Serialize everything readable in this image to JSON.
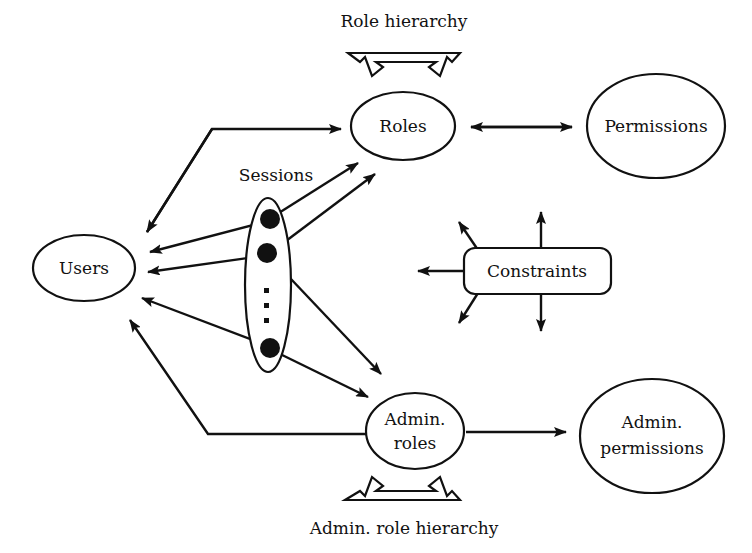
{
  "diagram": {
    "type": "node-link-diagram",
    "background_color": "#ffffff",
    "stroke_color": "#111111",
    "nodes": [
      {
        "id": "users",
        "label": "Users",
        "shape": "ellipse"
      },
      {
        "id": "roles",
        "label": "Roles",
        "shape": "ellipse"
      },
      {
        "id": "permissions",
        "label": "Permissions",
        "shape": "ellipse"
      },
      {
        "id": "sessions",
        "label": "Sessions",
        "shape": "tall-ellipse-with-dots"
      },
      {
        "id": "constraints",
        "label": "Constraints",
        "shape": "rounded-rectangle"
      },
      {
        "id": "admin-roles",
        "label_line1": "Admin.",
        "label_line2": "roles",
        "shape": "ellipse"
      },
      {
        "id": "admin-permissions",
        "label_line1": "Admin.",
        "label_line2": "permissions",
        "shape": "ellipse"
      }
    ],
    "labels": {
      "role_hierarchy": "Role hierarchy",
      "admin_role_hierarchy": "Admin. role hierarchy",
      "sessions": "Sessions",
      "users": "Users",
      "roles": "Roles",
      "permissions": "Permissions",
      "constraints": "Constraints",
      "admin_roles_line1": "Admin.",
      "admin_roles_line2": "roles",
      "admin_permissions_line1": "Admin.",
      "admin_permissions_line2": "permissions"
    },
    "edges": [
      {
        "id": "users-roles",
        "from": "users",
        "to": "roles",
        "style": "polyline",
        "arrows": "both"
      },
      {
        "id": "roles-permissions",
        "from": "roles",
        "to": "permissions",
        "style": "straight",
        "arrows": "both"
      },
      {
        "id": "session1-roles",
        "from": "sessions",
        "to": "roles",
        "style": "straight",
        "arrows": "end"
      },
      {
        "id": "session1-users",
        "from": "sessions",
        "to": "users",
        "style": "straight",
        "arrows": "end"
      },
      {
        "id": "session2-roles",
        "from": "sessions",
        "to": "roles",
        "style": "straight",
        "arrows": "end"
      },
      {
        "id": "session2-users",
        "from": "sessions",
        "to": "users",
        "style": "straight",
        "arrows": "end"
      },
      {
        "id": "session2-admin-roles",
        "from": "sessions",
        "to": "admin-roles",
        "style": "straight",
        "arrows": "end"
      },
      {
        "id": "session3-users",
        "from": "sessions",
        "to": "users",
        "style": "straight",
        "arrows": "end"
      },
      {
        "id": "session3-admin-roles",
        "from": "sessions",
        "to": "admin-roles",
        "style": "straight",
        "arrows": "end"
      },
      {
        "id": "admin-roles-users",
        "from": "admin-roles",
        "to": "users",
        "style": "polyline",
        "arrows": "end"
      },
      {
        "id": "admin-roles-admin-perms",
        "from": "admin-roles",
        "to": "admin-permissions",
        "style": "straight",
        "arrows": "end"
      },
      {
        "id": "role-hierarchy-loop",
        "from": "role-hierarchy-label",
        "to": "roles",
        "style": "hollow-v",
        "arrows": "both-down"
      },
      {
        "id": "admin-role-hierarchy-loop",
        "from": "admin-role-hierarchy-label",
        "to": "admin-roles",
        "style": "hollow-v",
        "arrows": "both-up"
      },
      {
        "id": "constraints-left",
        "from": "constraints",
        "to": "users-roles-edge",
        "style": "straight",
        "arrows": "end"
      },
      {
        "id": "constraints-up",
        "from": "constraints",
        "to": "roles-permissions-edge",
        "style": "straight",
        "arrows": "end"
      },
      {
        "id": "constraints-up-left",
        "from": "constraints",
        "to": "sessions-edge",
        "style": "straight",
        "arrows": "end"
      },
      {
        "id": "constraints-down",
        "from": "constraints",
        "to": "admin-permissions-edge",
        "style": "straight",
        "arrows": "end"
      },
      {
        "id": "constraints-down-left",
        "from": "constraints",
        "to": "admin-roles-edge",
        "style": "straight",
        "arrows": "end"
      }
    ],
    "session_dots_count": 3,
    "session_ellipsis_dots": 3
  }
}
